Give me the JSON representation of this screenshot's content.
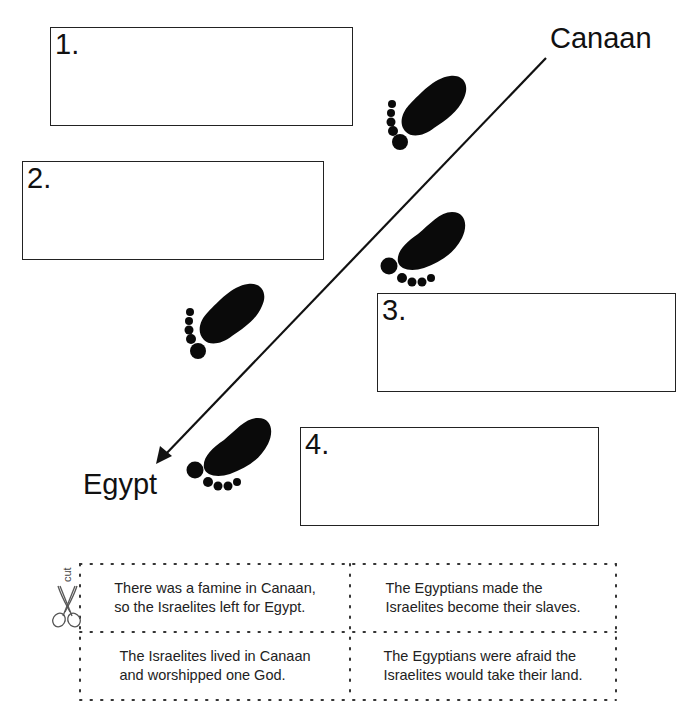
{
  "worksheet": {
    "places": {
      "start": "Canaan",
      "end": "Egypt"
    },
    "answer_boxes": [
      {
        "number": "1."
      },
      {
        "number": "2."
      },
      {
        "number": "3."
      },
      {
        "number": "4."
      }
    ],
    "journey_arrow": {
      "from": "Canaan",
      "to": "Egypt",
      "color": "#111111"
    },
    "footprints_count": 4,
    "cut_section": {
      "cut_label": "cut",
      "icon": "scissors-icon",
      "cards": [
        {
          "text_line1": "There was a famine in Canaan,",
          "text_line2": "so the Israelites left for Egypt."
        },
        {
          "text_line1": "The Egyptians made the",
          "text_line2": "Israelites become their slaves."
        },
        {
          "text_line1": "The Israelites lived in Canaan",
          "text_line2": "and worshipped one God."
        },
        {
          "text_line1": "The Egyptians were afraid the",
          "text_line2": "Israelites would take their land."
        }
      ]
    }
  }
}
